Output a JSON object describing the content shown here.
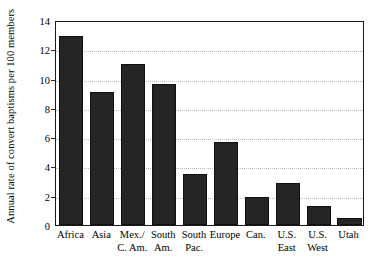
{
  "chart_data": {
    "type": "bar",
    "title": "",
    "xlabel": "",
    "ylabel": "Annual rate of convert baptisms per 100 members",
    "ylim": [
      0,
      14
    ],
    "yticks": [
      0,
      2,
      4,
      6,
      8,
      10,
      12,
      14
    ],
    "ytick_labels": [
      "0",
      "2",
      "4",
      "6",
      "8",
      "10",
      "12",
      "14"
    ],
    "grid": true,
    "grid_axis": "y",
    "legend": "none",
    "bar_color": "#252525",
    "categories": [
      "Africa",
      "Mex./ C. Am.",
      "Asia",
      "South Am.",
      "South Pac.",
      "Europe",
      "Can.",
      "U.S. East",
      "U.S. West",
      "Utah"
    ],
    "category_labels": [
      {
        "line1": "Africa",
        "line2": ""
      },
      {
        "line1": "Asia",
        "line2": ""
      },
      {
        "line1": "Mex./",
        "line2": "C. Am."
      },
      {
        "line1": "South",
        "line2": "Am."
      },
      {
        "line1": "South",
        "line2": "Pac."
      },
      {
        "line1": "Europe",
        "line2": ""
      },
      {
        "line1": "Can.",
        "line2": ""
      },
      {
        "line1": "U.S.",
        "line2": "East"
      },
      {
        "line1": "U.S.",
        "line2": "West"
      },
      {
        "line1": "Utah",
        "line2": ""
      }
    ],
    "values": [
      12.9,
      9.1,
      11.0,
      9.6,
      3.5,
      5.7,
      1.9,
      2.9,
      1.3,
      0.5
    ]
  }
}
